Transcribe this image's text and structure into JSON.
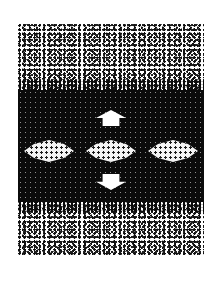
{
  "graphic": {
    "description": "Dithered halftone graphic: noise texture top and bottom, dark central band with three light lens shapes, up arrow above and down arrow below",
    "colors": {
      "background": "#ffffff",
      "band": "#0b0b0b",
      "lens": "#f4f4f4",
      "arrow": "#ffffff"
    },
    "icons": {
      "up": "arrow-up-icon",
      "down": "arrow-down-icon"
    },
    "lens_count": 3
  }
}
